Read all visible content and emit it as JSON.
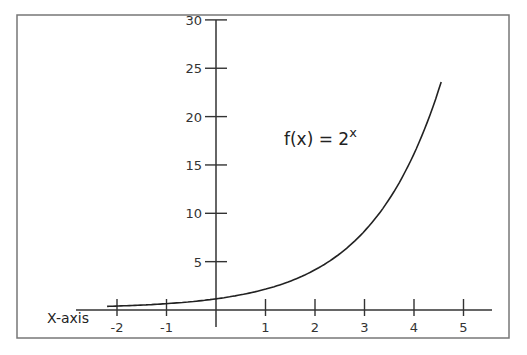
{
  "chart_data": {
    "type": "line",
    "title": "",
    "annotation": {
      "text": "f(x) = 2",
      "superscript": "x"
    },
    "xlabel": "X-axis",
    "ylabel": "",
    "x_ticks": [
      -2,
      -1,
      1,
      2,
      3,
      4,
      5
    ],
    "x_tick_labels": [
      "-2",
      "-1",
      "1",
      "2",
      "3",
      "4",
      "5"
    ],
    "y_ticks": [
      5,
      10,
      15,
      20,
      25,
      30
    ],
    "y_tick_labels": [
      "5",
      "10",
      "15",
      "20",
      "25",
      "30"
    ],
    "xlim": [
      -2.0,
      5.3
    ],
    "ylim": [
      -1,
      30
    ],
    "grid": false,
    "legend": null,
    "series": [
      {
        "name": "f(x) = 2^x",
        "x": [
          -2.2,
          -1.5,
          -1,
          -0.5,
          0,
          0.5,
          1,
          1.5,
          2,
          2.5,
          3,
          3.5,
          4,
          4.3,
          4.55
        ],
        "y": [
          0.22,
          0.35,
          0.5,
          0.71,
          1,
          1.41,
          2,
          2.83,
          4,
          5.66,
          8,
          11.31,
          16,
          19.7,
          23.4
        ],
        "color": "#222222"
      }
    ]
  }
}
